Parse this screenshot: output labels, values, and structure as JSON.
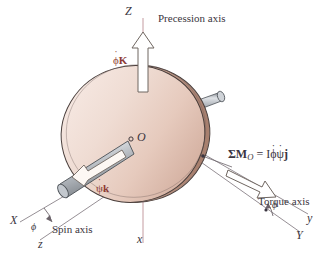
{
  "figure": {
    "background_color": "#ffffff",
    "disk": {
      "fill_light": "#f0ded7",
      "fill_mid": "#e3cabe",
      "fill_dark": "#c9a697",
      "outline_color": "#4a3f3c"
    },
    "shaft": {
      "fill_light": "#d8dade",
      "fill_mid": "#a9aeb4",
      "fill_dark": "#74797f",
      "outline_color": "#4a4a4e"
    },
    "axis_line_color": "#b08f94",
    "construction_line_color": "#8a8289",
    "arrow_outline_color": "#6f6660",
    "vector_label_color": "#8d3b34"
  },
  "labels": {
    "axis_Z": "Z",
    "axis_x_lower": "x",
    "axis_X_upper": "X",
    "axis_z_lower": "z",
    "axis_y_lower": "y",
    "axis_Y_upper": "Y",
    "point_O": "O",
    "precession_axis": "Precession axis",
    "spin_axis": "Spin axis",
    "torque_axis": "Torque axis",
    "angle_phi_left": "ϕ",
    "angle_phi_right": "ϕ",
    "precession_vector": {
      "symbol": "ϕ",
      "dot": "˙",
      "unit": "K"
    },
    "spin_vector": {
      "symbol": "ψ",
      "dot": "˙",
      "unit": "k"
    },
    "moment_equation": {
      "sum": "Σ",
      "M": "M",
      "subscript": "O",
      "equals": "=",
      "I": "I",
      "phi": "ϕ",
      "psi": "ψ",
      "dot": "˙",
      "j": "j"
    }
  }
}
